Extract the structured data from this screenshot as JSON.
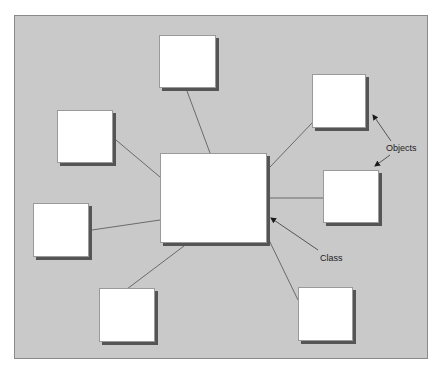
{
  "diagram": {
    "background_color": "#c9c9c9",
    "box_fill": "#ffffff",
    "shadow_color": "#555555",
    "line_color": "#6a6a6a",
    "labels": {
      "objects": "Objects",
      "class": "Class"
    },
    "class_box": {
      "id": "class",
      "x": 160,
      "y": 153,
      "w": 107,
      "h": 90
    },
    "object_boxes": [
      {
        "id": "object-top",
        "x": 159,
        "y": 35,
        "w": 57,
        "h": 53
      },
      {
        "id": "object-top-right",
        "x": 312,
        "y": 74,
        "w": 54,
        "h": 54
      },
      {
        "id": "object-right",
        "x": 323,
        "y": 170,
        "w": 56,
        "h": 53
      },
      {
        "id": "object-bottom-right",
        "x": 298,
        "y": 287,
        "w": 55,
        "h": 54
      },
      {
        "id": "object-bottom-left",
        "x": 99,
        "y": 288,
        "w": 56,
        "h": 54
      },
      {
        "id": "object-left-middle",
        "x": 33,
        "y": 203,
        "w": 56,
        "h": 54
      },
      {
        "id": "object-left-top",
        "x": 57,
        "y": 110,
        "w": 56,
        "h": 53
      }
    ],
    "connectors": [
      {
        "from": "class",
        "to": "object-top",
        "x1": 210,
        "y1": 153,
        "x2": 187,
        "y2": 91
      },
      {
        "from": "class",
        "to": "object-top-right",
        "x1": 270,
        "y1": 167,
        "x2": 312,
        "y2": 123
      },
      {
        "from": "class",
        "to": "object-right",
        "x1": 270,
        "y1": 198,
        "x2": 323,
        "y2": 198
      },
      {
        "from": "class",
        "to": "object-bottom-right",
        "x1": 268,
        "y1": 238,
        "x2": 298,
        "y2": 300
      },
      {
        "from": "class",
        "to": "object-bottom-left",
        "x1": 184,
        "y1": 246,
        "x2": 127,
        "y2": 289
      },
      {
        "from": "class",
        "to": "object-left-middle",
        "x1": 160,
        "y1": 220,
        "x2": 92,
        "y2": 230
      },
      {
        "from": "class",
        "to": "object-left-top",
        "x1": 160,
        "y1": 177,
        "x2": 116,
        "y2": 140
      }
    ],
    "annotation_arrows": [
      {
        "label": "objects",
        "x1": 391,
        "y1": 141,
        "x2": 373,
        "y2": 115
      },
      {
        "label": "objects",
        "x1": 390,
        "y1": 155,
        "x2": 375,
        "y2": 166
      },
      {
        "label": "class",
        "x1": 318,
        "y1": 250,
        "x2": 271,
        "y2": 218
      }
    ]
  }
}
